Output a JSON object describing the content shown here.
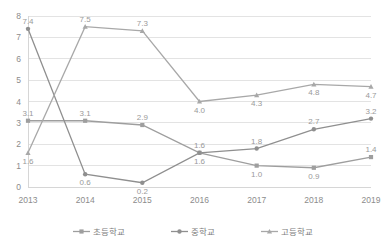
{
  "chart_data": {
    "type": "line",
    "title": "",
    "subtitle": "",
    "xlabel": "",
    "ylabel": "",
    "categories": [
      "2013",
      "2014",
      "2015",
      "2016",
      "2017",
      "2018",
      "2019"
    ],
    "ylim": [
      0,
      8
    ],
    "yticks": [
      "0",
      "1",
      "2",
      "3",
      "4",
      "5",
      "6",
      "7",
      "8"
    ],
    "grid": true,
    "legend_position": "bottom",
    "series": [
      {
        "name": "초등학교",
        "color": "#9e9e9e",
        "marker": "square",
        "values": [
          3.1,
          3.1,
          2.9,
          1.6,
          1.0,
          0.9,
          1.4
        ],
        "labels": [
          "3.1",
          "3.1",
          "2.9",
          "1.6",
          "1.0",
          "0.9",
          "1.4"
        ]
      },
      {
        "name": "중학교",
        "color": "#8f8f8f",
        "marker": "circle",
        "values": [
          7.4,
          0.6,
          0.2,
          1.6,
          1.8,
          2.7,
          3.2
        ],
        "labels": [
          "7.4",
          "0.6",
          "0.2",
          "1.6",
          "1.8",
          "2.7",
          "3.2"
        ]
      },
      {
        "name": "고등학교",
        "color": "#a8a8a8",
        "marker": "triangle",
        "values": [
          1.6,
          7.5,
          7.3,
          4.0,
          4.3,
          4.8,
          4.7
        ],
        "labels": [
          "1.6",
          "7.5",
          "7.3",
          "4.0",
          "4.3",
          "4.8",
          "4.7"
        ]
      }
    ]
  },
  "legend": {
    "items": [
      {
        "label": "초등학교"
      },
      {
        "label": "중학교"
      },
      {
        "label": "고등학교"
      }
    ]
  }
}
